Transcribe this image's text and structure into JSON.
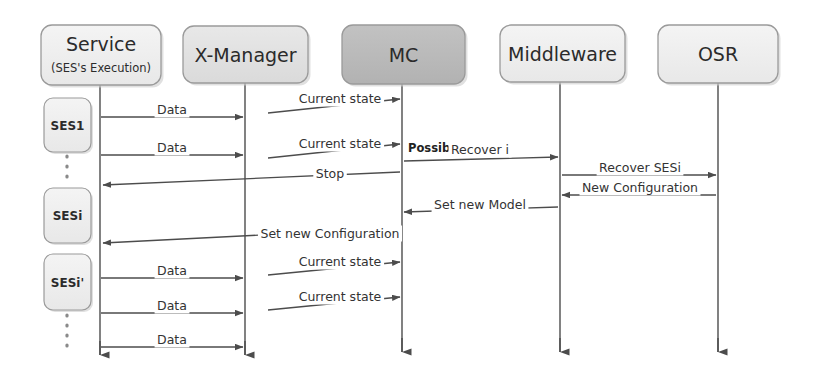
{
  "diagram": {
    "type": "uml-sequence-diagram",
    "width": 818,
    "height": 384,
    "background": "#ffffff",
    "colors": {
      "box_light": "#efeff0",
      "box_mid": "#e2e2e2",
      "box_dark": "#b9b9b9",
      "border": "#9a9a9a",
      "line": "#4c4c4c",
      "text": "#2b2b2b"
    }
  },
  "lifelines": [
    {
      "id": "service",
      "title": "Service",
      "subtitle": "(SES's Execution)",
      "shade": "light",
      "x": 100,
      "box": {
        "x": 41,
        "y": 25,
        "w": 120,
        "h": 60
      }
    },
    {
      "id": "xmanager",
      "title": "X-Manager",
      "subtitle": "",
      "shade": "mid",
      "x": 245,
      "box": {
        "x": 183,
        "y": 26,
        "w": 125,
        "h": 57
      }
    },
    {
      "id": "mc",
      "title": "MC",
      "subtitle": "",
      "shade": "dark",
      "x": 402,
      "box": {
        "x": 342,
        "y": 25,
        "w": 123,
        "h": 59
      }
    },
    {
      "id": "middleware",
      "title": "Middleware",
      "subtitle": "",
      "shade": "light",
      "x": 560,
      "box": {
        "x": 500,
        "y": 25,
        "w": 125,
        "h": 57
      }
    },
    {
      "id": "osr",
      "title": "OSR",
      "subtitle": "",
      "shade": "light",
      "x": 718,
      "box": {
        "x": 658,
        "y": 25,
        "w": 120,
        "h": 58
      }
    }
  ],
  "execution_blocks": [
    {
      "id": "ses1",
      "label": "SES1",
      "x": 44,
      "y": 98,
      "w": 47,
      "h": 54
    },
    {
      "id": "sesi",
      "label": "SESi",
      "x": 44,
      "y": 188,
      "w": 47,
      "h": 55
    },
    {
      "id": "sesip",
      "label": "SESi'",
      "x": 44,
      "y": 254,
      "w": 47,
      "h": 56
    }
  ],
  "continuation_dots": [
    {
      "id": "dots-top",
      "x": 67,
      "y1": 156,
      "y2": 184
    },
    {
      "id": "dots-bottom",
      "x": 67,
      "y1": 315,
      "y2": 352
    }
  ],
  "messages": [
    {
      "id": "m1",
      "label": "Data",
      "from": "service",
      "to": "xmanager",
      "x1": 101,
      "y1": 117,
      "x2": 243,
      "y2": 117,
      "dir": "right",
      "label_x": 172,
      "label_y": 114,
      "style": "normal"
    },
    {
      "id": "m2",
      "label": "Current state",
      "from": "xmanager",
      "to": "mc",
      "x1": 268,
      "y1": 113,
      "x2": 400,
      "y2": 99,
      "dir": "right",
      "label_x": 340,
      "label_y": 103,
      "style": "normal"
    },
    {
      "id": "m3",
      "label": "Data",
      "from": "service",
      "to": "xmanager",
      "x1": 101,
      "y1": 155,
      "x2": 243,
      "y2": 155,
      "dir": "right",
      "label_x": 172,
      "label_y": 152,
      "style": "normal"
    },
    {
      "id": "m4",
      "label": "Current state",
      "from": "xmanager",
      "to": "mc",
      "x1": 268,
      "y1": 158,
      "x2": 400,
      "y2": 144,
      "dir": "right",
      "label_x": 340,
      "label_y": 148,
      "style": "normal"
    },
    {
      "id": "m5",
      "label": "Possible fault",
      "from": "mc",
      "to": "mc",
      "x1": 402,
      "y1": 149,
      "x2": 402,
      "y2": 149,
      "dir": "none",
      "label_x": 408,
      "label_y": 152,
      "style": "bold"
    },
    {
      "id": "m6",
      "label": "Recover i",
      "from": "mc",
      "to": "middleware",
      "x1": 404,
      "y1": 161,
      "x2": 558,
      "y2": 157,
      "dir": "right",
      "label_x": 480,
      "label_y": 154,
      "style": "normal"
    },
    {
      "id": "m7",
      "label": "Recover SESi",
      "from": "middleware",
      "to": "osr",
      "x1": 562,
      "y1": 175,
      "x2": 716,
      "y2": 175,
      "dir": "right",
      "label_x": 640,
      "label_y": 172,
      "style": "normal"
    },
    {
      "id": "m8",
      "label": "Stop",
      "from": "mc",
      "to": "service",
      "x1": 400,
      "y1": 172,
      "x2": 103,
      "y2": 185,
      "dir": "left",
      "label_x": 330,
      "label_y": 178,
      "style": "normal"
    },
    {
      "id": "m9",
      "label": "New Configuration",
      "from": "osr",
      "to": "middleware",
      "x1": 716,
      "y1": 195,
      "x2": 562,
      "y2": 195,
      "dir": "left",
      "label_x": 640,
      "label_y": 192,
      "style": "normal"
    },
    {
      "id": "m10",
      "label": "Set new Model",
      "from": "middleware",
      "to": "mc",
      "x1": 558,
      "y1": 207,
      "x2": 404,
      "y2": 212,
      "dir": "left",
      "label_x": 480,
      "label_y": 209,
      "style": "normal"
    },
    {
      "id": "m11",
      "label": "Set new Configuration",
      "from": "mc",
      "to": "service",
      "x1": 400,
      "y1": 228,
      "x2": 103,
      "y2": 243,
      "dir": "left",
      "label_x": 330,
      "label_y": 238,
      "style": "normal"
    },
    {
      "id": "m12",
      "label": "Data",
      "from": "service",
      "to": "xmanager",
      "x1": 101,
      "y1": 278,
      "x2": 243,
      "y2": 278,
      "dir": "right",
      "label_x": 172,
      "label_y": 275,
      "style": "normal"
    },
    {
      "id": "m13",
      "label": "Current state",
      "from": "xmanager",
      "to": "mc",
      "x1": 268,
      "y1": 275,
      "x2": 400,
      "y2": 262,
      "dir": "right",
      "label_x": 340,
      "label_y": 266,
      "style": "normal"
    },
    {
      "id": "m14",
      "label": "Data",
      "from": "service",
      "to": "xmanager",
      "x1": 101,
      "y1": 313,
      "x2": 243,
      "y2": 313,
      "dir": "right",
      "label_x": 172,
      "label_y": 310,
      "style": "normal"
    },
    {
      "id": "m15",
      "label": "Current state",
      "from": "xmanager",
      "to": "mc",
      "x1": 268,
      "y1": 310,
      "x2": 400,
      "y2": 297,
      "dir": "right",
      "label_x": 340,
      "label_y": 301,
      "style": "normal"
    },
    {
      "id": "m16",
      "label": "Data",
      "from": "service",
      "to": "xmanager",
      "x1": 101,
      "y1": 347,
      "x2": 243,
      "y2": 347,
      "dir": "right",
      "label_x": 172,
      "label_y": 344,
      "style": "normal"
    }
  ],
  "lifeline_ends": [
    {
      "id": "end-service",
      "x": 100,
      "y": 355
    },
    {
      "id": "end-xmanager",
      "x": 245,
      "y": 355
    },
    {
      "id": "end-mc",
      "x": 402,
      "y": 352
    },
    {
      "id": "end-middleware",
      "x": 560,
      "y": 352
    },
    {
      "id": "end-osr",
      "x": 718,
      "y": 352
    }
  ]
}
